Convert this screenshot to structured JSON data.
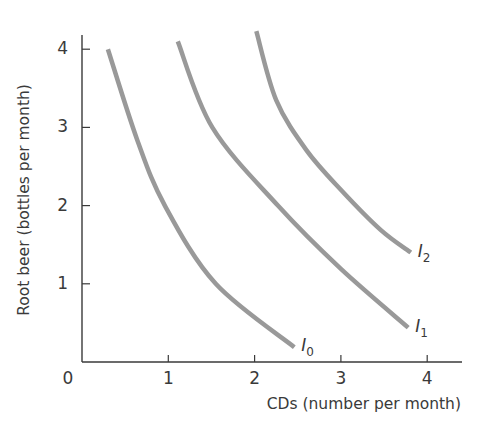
{
  "chart_data": {
    "type": "line",
    "title": "",
    "xlabel": "CDs (number per month)",
    "ylabel": "Root beer (bottles per month)",
    "xlim": [
      0,
      4.4
    ],
    "ylim": [
      0,
      4.2
    ],
    "x_ticks": [
      "0",
      "1",
      "2",
      "3",
      "4"
    ],
    "y_ticks": [
      "1",
      "2",
      "3",
      "4"
    ],
    "grid": false,
    "legend": "inline labels at curve ends",
    "line_color": "#999999",
    "series": [
      {
        "name": "I0",
        "label_main": "I",
        "label_sub": "0",
        "points": [
          [
            0.3,
            4.0
          ],
          [
            0.64,
            2.84
          ],
          [
            0.96,
            2.0
          ],
          [
            1.55,
            1.0
          ],
          [
            2.46,
            0.19
          ]
        ]
      },
      {
        "name": "I1",
        "label_main": "I",
        "label_sub": "1",
        "points": [
          [
            1.11,
            4.1
          ],
          [
            1.51,
            3.0
          ],
          [
            2.27,
            2.0
          ],
          [
            3.0,
            1.19
          ],
          [
            3.78,
            0.44
          ]
        ]
      },
      {
        "name": "I2",
        "label_main": "I",
        "label_sub": "2",
        "points": [
          [
            2.02,
            4.23
          ],
          [
            2.25,
            3.35
          ],
          [
            2.6,
            2.71
          ],
          [
            3.01,
            2.19
          ],
          [
            3.46,
            1.69
          ],
          [
            3.81,
            1.4
          ]
        ]
      }
    ]
  }
}
